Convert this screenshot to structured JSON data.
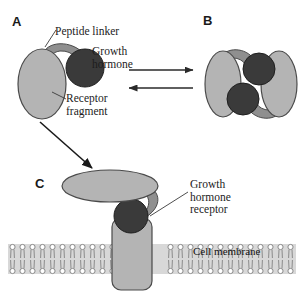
{
  "figure": {
    "background_color": "#ffffff"
  },
  "panels": [
    {
      "id": "A",
      "label": "A"
    },
    {
      "id": "B",
      "label": "B"
    },
    {
      "id": "C",
      "label": "C"
    }
  ],
  "labels": {
    "peptide_linker": "Peptide linker",
    "growth_hormone": "Growth\nhormone",
    "receptor_fragment": "Receptor\nfragment",
    "growth_hormone_receptor": "Growth\nhormone\nreceptor",
    "cell_membrane": "Cell membrane"
  },
  "colors": {
    "receptor_fill": "#b4b4b4",
    "receptor_stroke": "#4a4a4a",
    "hormone_fill": "#3a3a3a",
    "hormone_stroke": "#1f1f1f",
    "linker_fill": "#8f8f8f",
    "linker_stroke": "#4a4a4a",
    "membrane_band": "#d8d8d8",
    "lipid_stroke": "#8b8b8b",
    "text": "#1c1c1c",
    "arrow": "#2a2a2a"
  },
  "arrows": {
    "equilibrium_forward": "right-arrow",
    "equilibrium_reverse": "left-arrow",
    "a_to_c": "diagonal-arrow"
  }
}
